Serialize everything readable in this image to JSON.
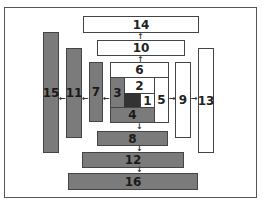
{
  "diagram": {
    "boxes": {
      "b1": "1",
      "b2": "2",
      "b3": "3",
      "b4": "4",
      "b5": "5",
      "b6": "6",
      "b7": "7",
      "b8": "8",
      "b9": "9",
      "b10": "10",
      "b11": "11",
      "b12": "12",
      "b13": "13",
      "b14": "14",
      "b15": "15",
      "b16": "16"
    },
    "arrows": {
      "left": "←",
      "right": "→",
      "up": "↑",
      "down": "↓"
    },
    "colors": {
      "gray": "#7b7b7b",
      "dark": "#333333",
      "white": "#ffffff",
      "border": "#444444"
    }
  }
}
